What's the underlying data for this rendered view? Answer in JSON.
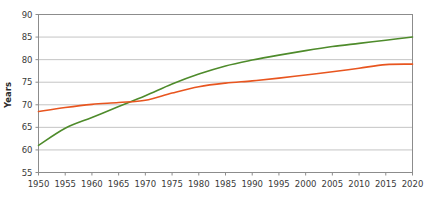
{
  "chart_data": {
    "type": "line",
    "title": "",
    "subtitle": "",
    "xlabel": "",
    "ylabel": "Years",
    "xlim": [
      1950,
      2020
    ],
    "ylim": [
      55,
      90
    ],
    "x_ticks": [
      1950,
      1955,
      1960,
      1965,
      1970,
      1975,
      1980,
      1985,
      1990,
      1995,
      2000,
      2005,
      2010,
      2015,
      2020
    ],
    "y_ticks": [
      55,
      60,
      65,
      70,
      75,
      80,
      85,
      90
    ],
    "grid": "horizontal",
    "legend": "none",
    "x": [
      1950,
      1955,
      1960,
      1965,
      1970,
      1975,
      1980,
      1985,
      1990,
      1995,
      2000,
      2005,
      2010,
      2015,
      2020
    ],
    "series": [
      {
        "name": "green-series",
        "color": "#4e8b2b",
        "values": [
          61.0,
          64.8,
          67.2,
          69.6,
          72.0,
          74.6,
          76.8,
          78.6,
          79.9,
          81.0,
          82.0,
          82.9,
          83.6,
          84.3,
          85.0
        ]
      },
      {
        "name": "orange-series",
        "color": "#e8551f",
        "values": [
          68.5,
          69.4,
          70.1,
          70.5,
          71.0,
          72.6,
          74.0,
          74.8,
          75.3,
          75.9,
          76.6,
          77.3,
          78.1,
          78.9,
          79.0
        ]
      }
    ],
    "axis_color": "#8c8c8c",
    "grid_color": "#c4c4c4",
    "background": "#ffffff",
    "line_width": 1.6
  }
}
